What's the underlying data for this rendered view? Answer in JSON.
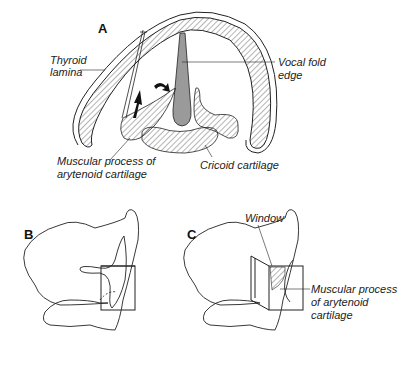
{
  "panels": {
    "a": {
      "letter": "A",
      "labels": {
        "thyroid_1": "Thyroid",
        "thyroid_2": "lamina",
        "vocal_1": "Vocal fold",
        "vocal_2": "edge",
        "muscular_1": "Muscular process of",
        "muscular_2": "arytenoid cartilage",
        "cricoid": "Cricoid cartilage"
      }
    },
    "b": {
      "letter": "B"
    },
    "c": {
      "letter": "C",
      "labels": {
        "window": "Window",
        "muscular_1": "Muscular process",
        "muscular_2": "of arytenoid",
        "muscular_3": "cartilage"
      }
    }
  },
  "colors": {
    "line": "#222222",
    "fill_gray": "#9a9a9a",
    "background": "#ffffff"
  }
}
